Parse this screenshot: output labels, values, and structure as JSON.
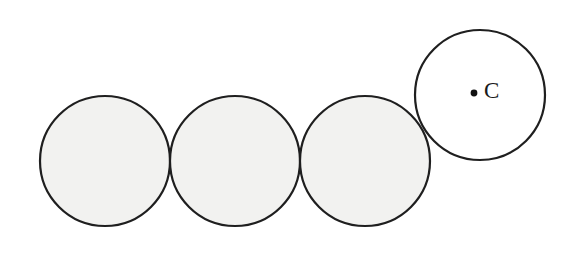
{
  "figure": {
    "canvas": {
      "width": 573,
      "height": 254,
      "background": "#ffffff"
    },
    "style": {
      "outline_color": "#1f1f1f",
      "outline_width": 2.2,
      "shaded_fill": "#f2f2f0",
      "open_fill": "#ffffff",
      "label_color": "#1a1a1a",
      "dot_color": "#111111"
    },
    "circles": [
      {
        "id": "circle-1",
        "name": "shaded-circle-left",
        "cx": 105,
        "cy": 161,
        "r": 65,
        "fill": "#f2f2f0",
        "shaded": true
      },
      {
        "id": "circle-2",
        "name": "shaded-circle-middle-left",
        "cx": 235,
        "cy": 161,
        "r": 65,
        "fill": "#f2f2f0",
        "shaded": true
      },
      {
        "id": "circle-3",
        "name": "shaded-circle-middle-right",
        "cx": 365,
        "cy": 161,
        "r": 65,
        "fill": "#f2f2f0",
        "shaded": true
      },
      {
        "id": "circle-4",
        "name": "open-circle-labeled-c",
        "cx": 480,
        "cy": 95,
        "r": 65,
        "fill": "#ffffff",
        "shaded": false
      }
    ],
    "points": [
      {
        "id": "point-c",
        "name": "center-point-c",
        "cx": 474,
        "cy": 93,
        "r": 3.4,
        "label": "C",
        "label_x": 484,
        "label_y": 93
      }
    ]
  }
}
